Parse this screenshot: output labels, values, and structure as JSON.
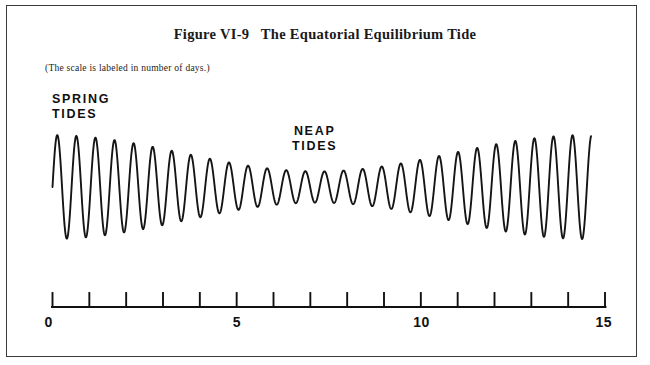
{
  "figure": {
    "title": "Figure VI-9   The Equatorial Equilibrium Tide",
    "scale_note": "(The scale is labeled in number of days.)",
    "border_color": "#3a3a3a",
    "curve_color": "#151515",
    "background": "#ffffff"
  },
  "annotations": [
    {
      "name": "spring-tides-label",
      "text": "SPRING\nTIDES"
    },
    {
      "name": "neap-tides-label",
      "text": "NEAP\nTIDES"
    }
  ],
  "axis": {
    "label_0": "0",
    "label_5": "5",
    "label_10": "10",
    "label_15": "15"
  },
  "chart_data": {
    "type": "line",
    "title": "Figure VI-9   The Equatorial Equilibrium Tide",
    "subtitle": "(The scale is labeled in number of days.)",
    "xlabel": "days",
    "ylabel": "",
    "xlim": [
      0,
      15
    ],
    "xticks": [
      0,
      1,
      2,
      3,
      4,
      5,
      6,
      7,
      8,
      9,
      10,
      11,
      12,
      13,
      14,
      15
    ],
    "xtick_labels": [
      "0",
      "",
      "",
      "",
      "",
      "5",
      "",
      "",
      "",
      "",
      "10",
      "",
      "",
      "",
      "",
      "15"
    ],
    "grid": false,
    "legend": "none",
    "annotations": [
      {
        "text": "SPRING TIDES",
        "x": 0.5,
        "note": "large amplitude at start of record"
      },
      {
        "text": "NEAP TIDES",
        "x": 7.2,
        "note": "minimum amplitude near middle of record"
      }
    ],
    "series": [
      {
        "name": "Equatorial equilibrium tide height",
        "model": {
          "carrier_cycles_per_day": 1.93,
          "carrier_phase_deg": 0,
          "envelope_cycles_per_day": 0.0685,
          "envelope_min_day": 7.2,
          "envelope_max_amplitude": 1.0,
          "envelope_min_amplitude": 0.3
        },
        "x": [
          0.0,
          0.25,
          0.5,
          0.75,
          1.0,
          1.25,
          1.5,
          1.75,
          2.0,
          2.25,
          2.5,
          2.75,
          3.0,
          3.25,
          3.5,
          3.75,
          4.0,
          4.25,
          4.5,
          4.75,
          5.0,
          5.25,
          5.5,
          5.75,
          6.0,
          6.25,
          6.5,
          6.75,
          7.0,
          7.25,
          7.5,
          7.75,
          8.0,
          8.25,
          8.5,
          8.75,
          9.0,
          9.25,
          9.5,
          9.75,
          10.0,
          10.25,
          10.5,
          10.75,
          11.0,
          11.25,
          11.5,
          11.75,
          12.0,
          12.25,
          12.5,
          12.75,
          13.0,
          13.25,
          13.5,
          13.75,
          14.0,
          14.25,
          14.5,
          14.75,
          15.0
        ],
        "y": [
          0.0,
          0.98,
          -0.06,
          -0.96,
          0.12,
          0.92,
          -0.18,
          -0.86,
          0.24,
          0.8,
          -0.3,
          -0.73,
          0.34,
          0.65,
          -0.38,
          -0.57,
          0.41,
          0.49,
          -0.43,
          -0.41,
          0.44,
          0.35,
          -0.44,
          -0.32,
          0.42,
          0.31,
          -0.4,
          -0.3,
          0.33,
          0.3,
          -0.31,
          -0.32,
          0.3,
          0.35,
          -0.31,
          -0.39,
          0.34,
          0.44,
          -0.38,
          -0.5,
          0.43,
          0.56,
          -0.48,
          -0.62,
          0.54,
          0.68,
          -0.6,
          -0.74,
          0.66,
          0.79,
          -0.71,
          -0.84,
          0.76,
          0.88,
          -0.81,
          -0.91,
          0.85,
          0.93,
          -0.88,
          -0.94,
          0.4
        ],
        "units": "arbitrary (tide height)"
      }
    ]
  }
}
